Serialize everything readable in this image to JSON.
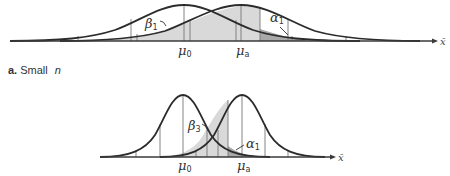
{
  "panels": [
    {
      "id": "a",
      "label_letter": "a.",
      "label_text": "Small",
      "label_var": "n",
      "mu0_label": "μ",
      "mu0_sub": "0",
      "mua_label": "μ",
      "mua_sub": "a",
      "beta_label": "β",
      "beta_sub": "1",
      "alpha_label": "α",
      "alpha_sub": "1",
      "axis_label": "x̄"
    },
    {
      "id": "b",
      "mu0_label": "μ",
      "mu0_sub": "0",
      "mua_label": "μ",
      "mua_sub": "a",
      "beta_label": "β",
      "beta_sub": "3",
      "alpha_label": "α",
      "alpha_sub": "1",
      "axis_label": "x̄"
    }
  ],
  "colors": {
    "beta_region": "#d9d9d9",
    "alpha_region": "#a9a9a9",
    "curve": "#2b2b2b"
  }
}
